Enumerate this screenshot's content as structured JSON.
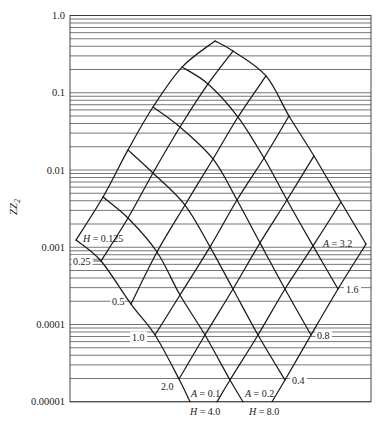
{
  "chart_data": {
    "type": "line",
    "title": "",
    "xlabel": "",
    "ylabel": "ZZ2",
    "ylabel_parts": {
      "main": "ZZ",
      "sub": "2"
    },
    "yscale": "log",
    "ylim": [
      1e-05,
      1.0
    ],
    "grid": {
      "horizontal": true,
      "vertical": false,
      "minor_multiples": [
        1,
        2,
        3,
        4,
        5,
        6,
        7,
        8,
        9
      ]
    },
    "legend": null,
    "yticks": [
      {
        "value": 1.0,
        "label": "1.0"
      },
      {
        "value": 0.1,
        "label": "0.1"
      },
      {
        "value": 0.01,
        "label": "0.01"
      },
      {
        "value": 0.001,
        "label": "0.001"
      },
      {
        "value": 0.0001,
        "label": "0.0001"
      },
      {
        "value": 1e-05,
        "label": "0.00001"
      }
    ],
    "point_format": "[x_px, ZZ2]",
    "series": [
      {
        "family": "H",
        "name": "H = 0.125",
        "value": 0.125,
        "points": [
          [
            76,
            0.00124
          ],
          [
            103,
            0.00447
          ],
          [
            128,
            0.0182
          ],
          [
            153,
            0.0654
          ],
          [
            182,
            0.215
          ],
          [
            215,
            0.468
          ]
        ]
      },
      {
        "family": "H",
        "name": "H = 0.25",
        "value": 0.25,
        "points": [
          [
            101,
            0.000664
          ],
          [
            128,
            0.00239
          ],
          [
            153,
            0.00915
          ],
          [
            180,
            0.036
          ],
          [
            208,
            0.13
          ],
          [
            233,
            0.347
          ]
        ]
      },
      {
        "family": "H",
        "name": "H = 0.5",
        "value": 0.5,
        "points": [
          [
            131,
            0.000184
          ],
          [
            157,
            0.000868
          ],
          [
            185,
            0.00352
          ],
          [
            213,
            0.0139
          ],
          [
            238,
            0.0485
          ],
          [
            266,
            0.165
          ]
        ]
      },
      {
        "family": "H",
        "name": "H = 1.0",
        "value": 1.0,
        "points": [
          [
            155,
            7.31e-05
          ],
          [
            180,
            0.000241
          ],
          [
            210,
            0.00101
          ],
          [
            237,
            0.00409
          ],
          [
            264,
            0.0143
          ],
          [
            289,
            0.05
          ]
        ]
      },
      {
        "family": "H",
        "name": "H = 2.0",
        "value": 2.0,
        "points": [
          [
            179,
            1.97e-05
          ],
          [
            205,
            7.31e-05
          ],
          [
            233,
            0.000288
          ],
          [
            260,
            0.00114
          ],
          [
            287,
            0.00409
          ],
          [
            314,
            0.0152
          ]
        ]
      },
      {
        "family": "H",
        "name": "H = 4.0",
        "value": 4.0,
        "points": [
          [
            217,
            1e-05
          ],
          [
            230,
            1.91e-05
          ],
          [
            258,
            7.31e-05
          ],
          [
            285,
            0.000288
          ],
          [
            313,
            0.00104
          ],
          [
            341,
            0.00385
          ]
        ]
      },
      {
        "family": "H",
        "name": "H = 8.0",
        "value": 8.0,
        "points": [
          [
            272,
            1e-05
          ],
          [
            285,
            1.91e-05
          ],
          [
            311,
            7.31e-05
          ],
          [
            338,
            0.000288
          ],
          [
            366,
            0.0011
          ]
        ]
      },
      {
        "family": "A",
        "name": "A = 0.1",
        "value": 0.1,
        "points": [
          [
            76,
            0.00124
          ],
          [
            101,
            0.000664
          ],
          [
            131,
            0.000184
          ],
          [
            155,
            7.31e-05
          ],
          [
            179,
            1.97e-05
          ],
          [
            190,
            1e-05
          ]
        ]
      },
      {
        "family": "A",
        "name": "A = 0.2",
        "value": 0.2,
        "points": [
          [
            103,
            0.00447
          ],
          [
            128,
            0.00239
          ],
          [
            157,
            0.000868
          ],
          [
            180,
            0.000241
          ],
          [
            205,
            7.31e-05
          ],
          [
            230,
            1.91e-05
          ],
          [
            243,
            1e-05
          ]
        ]
      },
      {
        "family": "A",
        "name": "A = 0.4",
        "value": 0.4,
        "points": [
          [
            128,
            0.0182
          ],
          [
            153,
            0.00915
          ],
          [
            185,
            0.00352
          ],
          [
            210,
            0.00101
          ],
          [
            233,
            0.000288
          ],
          [
            258,
            7.31e-05
          ],
          [
            285,
            1.91e-05
          ]
        ]
      },
      {
        "family": "A",
        "name": "A = 0.8",
        "value": 0.8,
        "points": [
          [
            153,
            0.0654
          ],
          [
            180,
            0.036
          ],
          [
            213,
            0.0139
          ],
          [
            237,
            0.00409
          ],
          [
            260,
            0.00114
          ],
          [
            285,
            0.000288
          ],
          [
            311,
            7.31e-05
          ]
        ]
      },
      {
        "family": "A",
        "name": "A = 1.6",
        "value": 1.6,
        "points": [
          [
            182,
            0.215
          ],
          [
            208,
            0.13
          ],
          [
            238,
            0.0485
          ],
          [
            264,
            0.0143
          ],
          [
            287,
            0.00409
          ],
          [
            313,
            0.00104
          ],
          [
            338,
            0.000288
          ]
        ]
      },
      {
        "family": "A",
        "name": "A = 3.2",
        "value": 3.2,
        "points": [
          [
            215,
            0.468
          ],
          [
            233,
            0.347
          ],
          [
            266,
            0.165
          ],
          [
            289,
            0.05
          ],
          [
            314,
            0.0152
          ],
          [
            341,
            0.00385
          ],
          [
            366,
            0.0011
          ]
        ]
      }
    ],
    "annotations": [
      {
        "symbol": "H",
        "rest": " = 0.125"
      },
      {
        "symbol": "",
        "rest": "0.25"
      },
      {
        "symbol": "",
        "rest": "0.5"
      },
      {
        "symbol": "",
        "rest": "1.0"
      },
      {
        "symbol": "",
        "rest": "2.0"
      },
      {
        "symbol": "H",
        "rest": " = 4.0"
      },
      {
        "symbol": "H",
        "rest": " = 8.0"
      },
      {
        "symbol": "A",
        "rest": " = 0.1"
      },
      {
        "symbol": "A",
        "rest": " = 0.2"
      },
      {
        "symbol": "",
        "rest": "0.4"
      },
      {
        "symbol": "",
        "rest": "0.8"
      },
      {
        "symbol": "",
        "rest": "1.6"
      },
      {
        "symbol": "A",
        "rest": " = 3.2"
      }
    ]
  }
}
